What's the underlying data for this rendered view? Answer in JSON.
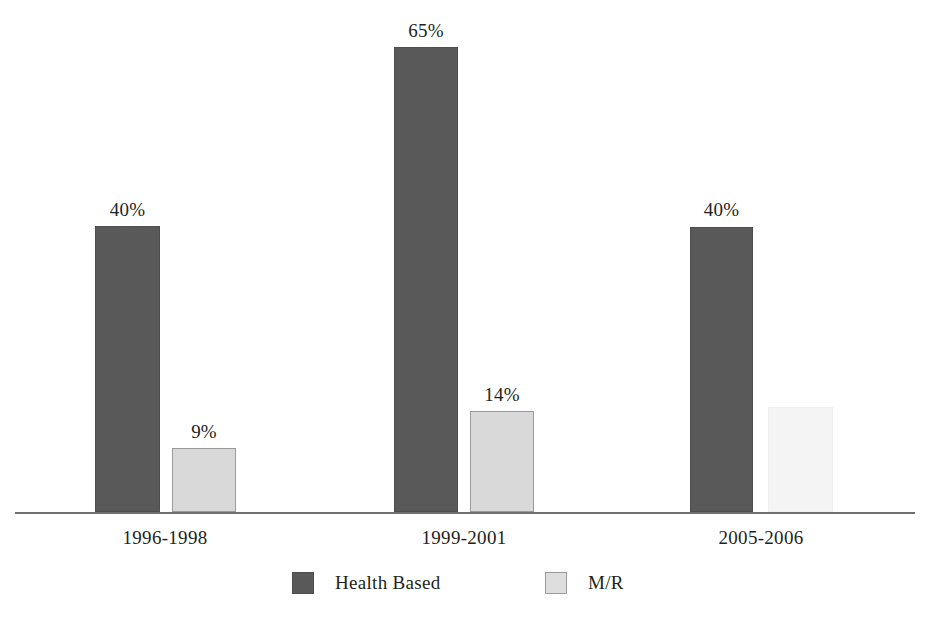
{
  "chart_data": {
    "type": "bar",
    "title": "",
    "subtitle": "",
    "xlabel": "",
    "ylabel": "",
    "ylim": [
      0,
      70
    ],
    "grid": false,
    "legend_position": "bottom-center",
    "categories": [
      "1996-1998",
      "1999-2001",
      "2005-2006"
    ],
    "series": [
      {
        "name": "Health Based",
        "color": "#595959",
        "values": [
          40,
          65,
          40
        ],
        "labels": [
          "40%",
          "65%",
          "40%"
        ]
      },
      {
        "name": "M/R",
        "color": "#d9d9d9",
        "values": [
          9,
          14,
          14.7
        ],
        "labels": [
          "9%",
          "14%",
          ""
        ]
      }
    ],
    "value_label_suffix": "%",
    "axis_color": "#6f6f6f"
  },
  "bars": [
    {
      "name": "health-based-1996-1998",
      "series": "Health Based",
      "category": "1996-1998",
      "value_label": "40%",
      "left": 95,
      "width": 65,
      "height": 286,
      "style": "bar-dark",
      "label_left": 85,
      "label_top": 200
    },
    {
      "name": "mr-1996-1998",
      "series": "M/R",
      "category": "1996-1998",
      "value_label": "9%",
      "left": 172,
      "width": 64,
      "height": 64,
      "style": "bar-light",
      "label_left": 162,
      "label_top": 422
    },
    {
      "name": "health-based-1999-2001",
      "series": "Health Based",
      "category": "1999-2001",
      "value_label": "65%",
      "left": 394,
      "width": 64,
      "height": 465,
      "style": "bar-dark",
      "label_left": 384,
      "label_top": 21
    },
    {
      "name": "mr-1999-2001",
      "series": "M/R",
      "category": "1999-2001",
      "value_label": "14%",
      "left": 470,
      "width": 64,
      "height": 101,
      "style": "bar-light",
      "label_left": 460,
      "label_top": 385
    },
    {
      "name": "health-based-2005-2006",
      "series": "Health Based",
      "category": "2005-2006",
      "value_label": "40%",
      "left": 690,
      "width": 63,
      "height": 285,
      "style": "bar-dark",
      "label_left": 680,
      "label_top": 200
    },
    {
      "name": "mr-2005-2006",
      "series": "M/R",
      "category": "2005-2006",
      "value_label": "",
      "left": 768,
      "width": 65,
      "height": 105,
      "style": "bar-faint",
      "label_left": 758,
      "label_top": 382
    }
  ],
  "category_labels": [
    {
      "text": "1996-1998",
      "left": 105,
      "width": 120
    },
    {
      "text": "1999-2001",
      "left": 404,
      "width": 120
    },
    {
      "text": "2005-2006",
      "left": 701,
      "width": 120
    }
  ],
  "legend": {
    "items": [
      {
        "label": "Health Based",
        "swatch_style": "swatch-dark",
        "left": 292
      },
      {
        "label": "M/R",
        "swatch_style": "swatch-light",
        "left": 545
      }
    ]
  }
}
